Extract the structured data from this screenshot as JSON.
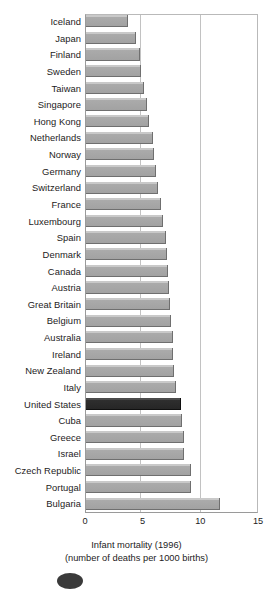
{
  "chart_data": {
    "type": "bar",
    "orientation": "horizontal",
    "title": "",
    "xlabel": "Infant mortality (1996)",
    "xlabel_sub": "(number of deaths per 1000 births)",
    "ylabel": "",
    "xlim": [
      0,
      15
    ],
    "xticks": [
      0,
      5,
      10,
      15
    ],
    "xtick_labels": [
      "0",
      "5",
      "10",
      "15"
    ],
    "grid": true,
    "grid_axis": "x",
    "legend": false,
    "highlight_category": "United States",
    "categories": [
      "Iceland",
      "Japan",
      "Finland",
      "Sweden",
      "Taiwan",
      "Singapore",
      "Hong Kong",
      "Netherlands",
      "Norway",
      "Germany",
      "Switzerland",
      "France",
      "Luxembourg",
      "Spain",
      "Denmark",
      "Canada",
      "Austria",
      "Great Britain",
      "Belgium",
      "Australia",
      "Ireland",
      "New Zealand",
      "Italy",
      "United States",
      "Cuba",
      "Greece",
      "Israel",
      "Czech Republic",
      "Portugal",
      "Bulgaria"
    ],
    "values": [
      3.6,
      4.3,
      4.7,
      4.8,
      5.0,
      5.3,
      5.5,
      5.8,
      5.9,
      6.1,
      6.2,
      6.5,
      6.7,
      6.9,
      7.0,
      7.1,
      7.2,
      7.3,
      7.4,
      7.5,
      7.5,
      7.6,
      7.8,
      8.2,
      8.3,
      8.5,
      8.5,
      9.1,
      9.1,
      11.6
    ],
    "colors": {
      "bar": "#a8a8a8",
      "bar_highlight": "#2f2f2f",
      "gridline": "#c2c2c2",
      "axis": "#9a9a9a",
      "text": "#1d1b1c",
      "background": "#ffffff"
    }
  }
}
